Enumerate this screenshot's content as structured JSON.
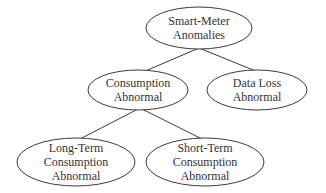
{
  "diagram": {
    "type": "tree",
    "colors": {
      "stroke": "#3a3a3a",
      "text": "#333333",
      "background": "#ffffff",
      "fill": "#ffffff"
    },
    "nodes": [
      {
        "id": "root",
        "lines": [
          "Smart-Meter",
          "Anomalies"
        ],
        "cx": 199,
        "cy": 28,
        "rx": 53,
        "ry": 21
      },
      {
        "id": "consumption",
        "lines": [
          "Consumption",
          "Abnormal"
        ],
        "cx": 138,
        "cy": 90,
        "rx": 50,
        "ry": 20
      },
      {
        "id": "dataloss",
        "lines": [
          "Data Loss",
          "Abnormal"
        ],
        "cx": 257,
        "cy": 90,
        "rx": 50,
        "ry": 20
      },
      {
        "id": "longterm",
        "lines": [
          "Long-Term",
          "Consumption",
          "Abnormal"
        ],
        "cx": 76,
        "cy": 162,
        "rx": 59,
        "ry": 24
      },
      {
        "id": "shortterm",
        "lines": [
          "Short-Term",
          "Consumption",
          "Abnormal"
        ],
        "cx": 205,
        "cy": 162,
        "rx": 59,
        "ry": 24
      }
    ],
    "edges": [
      {
        "from": "root",
        "to": "consumption",
        "x1": 199,
        "y1": 48,
        "x2": 143,
        "y2": 72
      },
      {
        "from": "root",
        "to": "dataloss",
        "x1": 199,
        "y1": 48,
        "x2": 258,
        "y2": 72
      },
      {
        "from": "consumption",
        "to": "longterm",
        "x1": 140,
        "y1": 108,
        "x2": 78,
        "y2": 140
      },
      {
        "from": "consumption",
        "to": "shortterm",
        "x1": 140,
        "y1": 108,
        "x2": 204,
        "y2": 140
      }
    ]
  }
}
